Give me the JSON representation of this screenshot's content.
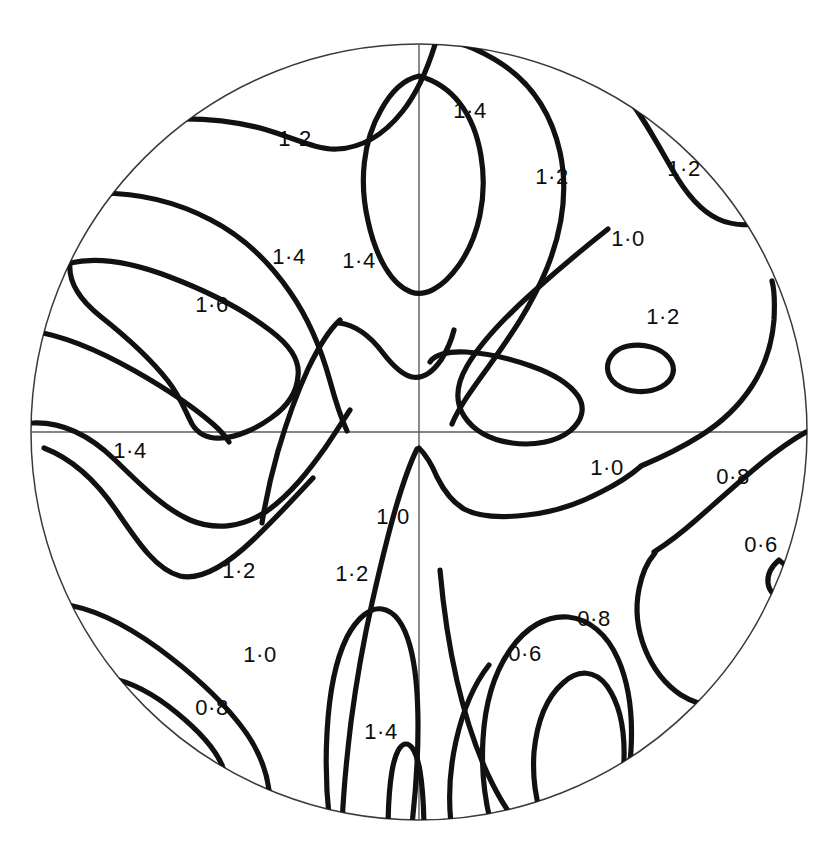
{
  "figure": {
    "kind": "stereographic-pole-figure",
    "title": "",
    "background_color": "#ffffff",
    "contour_color": "#111111",
    "outline_color": "#3a3a3a",
    "axis_color": "#5a5a5a"
  },
  "projection": {
    "center_x": 419,
    "center_y": 432,
    "radius": 388,
    "outline_stroke_width": 1.5,
    "contour_stroke_width": 5.2
  },
  "axes": {
    "horizontal": {
      "x1": 31,
      "y1": 432,
      "x2": 807,
      "y2": 432
    },
    "vertical": {
      "x1": 419,
      "y1": 44,
      "x2": 419,
      "y2": 820
    }
  },
  "chart_data": {
    "type": "contour",
    "title": "",
    "xlabel": "",
    "ylabel": "",
    "grid": false,
    "legend": "none",
    "units": "times random",
    "contour_interval": 0.2,
    "levels": [
      0.6,
      0.8,
      1.0,
      1.2,
      1.4,
      1.6
    ],
    "min_level": 0.6,
    "max_level": 1.6,
    "label_count": 21,
    "labels": [
      {
        "id": "lbl-1",
        "text": "1·2",
        "value": 1.2,
        "x": 295,
        "y": 140
      },
      {
        "id": "lbl-2",
        "text": "1·4",
        "value": 1.4,
        "x": 470,
        "y": 112
      },
      {
        "id": "lbl-3",
        "text": "1·2",
        "value": 1.2,
        "x": 552,
        "y": 178
      },
      {
        "id": "lbl-4",
        "text": "1·2",
        "value": 1.2,
        "x": 684,
        "y": 170
      },
      {
        "id": "lbl-5",
        "text": "1·4",
        "value": 1.4,
        "x": 289,
        "y": 258
      },
      {
        "id": "lbl-6",
        "text": "1·4",
        "value": 1.4,
        "x": 359,
        "y": 262
      },
      {
        "id": "lbl-7",
        "text": "1·0",
        "value": 1.0,
        "x": 628,
        "y": 240
      },
      {
        "id": "lbl-8",
        "text": "1·6",
        "value": 1.6,
        "x": 212,
        "y": 306
      },
      {
        "id": "lbl-9",
        "text": "1·2",
        "value": 1.2,
        "x": 663,
        "y": 318
      },
      {
        "id": "lbl-10",
        "text": "1·4",
        "value": 1.4,
        "x": 130,
        "y": 452
      },
      {
        "id": "lbl-11",
        "text": "1·0",
        "value": 1.0,
        "x": 607,
        "y": 469
      },
      {
        "id": "lbl-12",
        "text": "0·8",
        "value": 0.8,
        "x": 733,
        "y": 478
      },
      {
        "id": "lbl-13",
        "text": "1·0",
        "value": 1.0,
        "x": 393,
        "y": 518
      },
      {
        "id": "lbl-14",
        "text": "0·6",
        "value": 0.6,
        "x": 761,
        "y": 546
      },
      {
        "id": "lbl-15",
        "text": "1·2",
        "value": 1.2,
        "x": 239,
        "y": 572
      },
      {
        "id": "lbl-16",
        "text": "1·2",
        "value": 1.2,
        "x": 352,
        "y": 575
      },
      {
        "id": "lbl-17",
        "text": "0·8",
        "value": 0.8,
        "x": 594,
        "y": 620
      },
      {
        "id": "lbl-18",
        "text": "1·0",
        "value": 1.0,
        "x": 260,
        "y": 656
      },
      {
        "id": "lbl-19",
        "text": "0·6",
        "value": 0.6,
        "x": 525,
        "y": 655
      },
      {
        "id": "lbl-20",
        "text": "0·8",
        "value": 0.8,
        "x": 212,
        "y": 709
      },
      {
        "id": "lbl-21",
        "text": "1·4",
        "value": 1.4,
        "x": 381,
        "y": 733
      }
    ],
    "contours": [
      {
        "id": "c-top-arc-left",
        "level": 1.2,
        "closed": false,
        "d": "M 172 119 C 205 118 240 122 267 130 C 296 139 318 150 337 149 C 360 148 382 137 402 112 C 419 91 430 62 437 38"
      },
      {
        "id": "c-top-band-right",
        "level": 1.2,
        "closed": false,
        "d": "M 400 36 C 424 32 460 39 494 59 C 530 80 551 112 560 152 C 568 189 563 228 547 268 C 531 307 509 338 489 366 C 470 392 458 409 452 424"
      },
      {
        "id": "c-top-lobe-1_4",
        "level": 1.4,
        "closed": true,
        "d": "M 419 76 C 452 85 474 113 481 156 C 488 198 478 238 459 265 C 442 289 424 297 411 292 C 392 285 376 258 368 221 C 359 182 363 141 381 110 C 392 90 405 79 419 76 Z"
      },
      {
        "id": "c-upper-left-1_4",
        "level": 1.4,
        "closed": false,
        "d": "M 100 193 C 137 193 175 201 211 220 C 246 238 270 263 290 292 C 311 322 322 352 330 381 C 336 403 341 418 347 431"
      },
      {
        "id": "c-left-1_6-outer",
        "level": 1.6,
        "closed": true,
        "d": "M 70 263 C 96 257 131 262 170 277 C 212 293 248 313 271 331 C 292 347 300 361 298 376 C 297 392 288 406 271 418 C 256 429 237 437 222 438 C 208 439 198 434 192 424 C 185 411 180 396 168 381 C 150 358 124 335 100 316 C 80 300 68 283 70 263 Z"
      },
      {
        "id": "c-left-1_6-inner",
        "level": 1.6,
        "closed": false,
        "d": "M 32 331 C 60 335 96 349 135 371 C 172 392 198 411 213 424 C 221 431 226 437 229 442"
      },
      {
        "id": "c-left-lower-1_4",
        "level": 1.4,
        "closed": false,
        "d": "M 33 423 C 60 422 88 434 114 459 C 140 484 163 508 190 520 C 216 531 243 527 267 511 C 291 494 310 469 325 448 C 336 432 344 419 350 410"
      },
      {
        "id": "c-upperright-1_0-spike",
        "level": 1.0,
        "closed": false,
        "d": "M 608 229 C 589 244 562 266 532 293 C 503 319 480 344 467 366 C 456 385 455 402 464 416 C 473 430 490 440 512 443 C 534 446 556 442 570 431 C 582 421 586 408 578 396 C 569 383 551 373 531 366 C 506 357 483 353 466 352 C 447 351 434 355 430 362"
      },
      {
        "id": "c-upperright-1_2-island",
        "level": 1.2,
        "closed": true,
        "d": "M 628 346 C 644 343 661 348 669 358 C 677 368 674 380 661 387 C 647 394 628 393 616 384 C 605 375 605 362 614 353 C 618 349 623 347 628 346 Z"
      },
      {
        "id": "c-top-right-corner-1_2",
        "level": 1.2,
        "closed": false,
        "d": "M 622 90 C 641 113 657 143 672 169 C 686 194 701 211 718 219 C 733 226 752 226 768 222"
      },
      {
        "id": "c-center-saddle",
        "level": 1.2,
        "closed": false,
        "d": "M 339 323 C 356 325 371 337 383 353 C 393 366 403 375 412 377 C 422 379 432 373 441 360 C 448 349 452 338 454 330"
      },
      {
        "id": "c-center-left-drop",
        "level": 1.2,
        "closed": false,
        "d": "M 340 320 C 330 329 319 346 308 369 C 296 395 286 424 278 451 C 270 479 265 504 262 523"
      },
      {
        "id": "c-center-down-1_0",
        "level": 1.0,
        "closed": false,
        "d": "M 419 448 C 426 455 432 465 437 477 C 444 491 452 502 464 509 C 479 517 502 518 527 515 C 556 512 582 502 601 492 C 619 483 632 474 640 467"
      },
      {
        "id": "c-center-down-left",
        "level": 1.0,
        "closed": false,
        "d": "M 417 449 C 411 461 404 480 396 507 C 387 538 379 572 372 603 C 363 643 356 684 351 722 C 346 763 343 800 342 826"
      },
      {
        "id": "c-right-1_0-to-edge",
        "level": 1.0,
        "closed": false,
        "d": "M 641 466 C 660 458 681 448 700 436 C 721 423 739 406 752 386 C 765 366 772 345 774 320 C 775 300 774 288 772 281"
      },
      {
        "id": "c-right-0_8",
        "level": 0.8,
        "closed": false,
        "d": "M 806 432 C 790 441 772 454 752 471 C 731 489 712 506 696 520 C 679 535 665 545 654 552"
      },
      {
        "id": "c-right-0_8-lower",
        "level": 0.8,
        "closed": false,
        "d": "M 655 553 C 648 561 642 573 639 589 C 635 609 637 629 645 649 C 653 669 666 685 681 695 C 694 703 707 706 718 704"
      },
      {
        "id": "c-right-0_6-hook",
        "level": 0.6,
        "closed": false,
        "d": "M 779 560 C 772 566 767 574 768 583 C 769 592 776 598 784 597 C 791 595 795 588 793 580 C 791 572 786 565 779 560 Z"
      },
      {
        "id": "c-lowerleft-1_2",
        "level": 1.2,
        "closed": false,
        "d": "M 44 448 C 70 458 96 480 118 513 C 139 544 157 570 180 576 C 203 581 229 563 254 539 C 277 517 297 495 313 478"
      },
      {
        "id": "c-lowerleft-1_0",
        "level": 1.0,
        "closed": false,
        "d": "M 61 604 C 88 607 122 622 158 648 C 192 673 219 698 238 722 C 256 744 266 767 269 790 C 271 809 270 822 268 831"
      },
      {
        "id": "c-lowerleft-0_8",
        "level": 0.8,
        "closed": false,
        "d": "M 110 678 C 131 682 154 694 177 713 C 199 731 215 749 222 765 C 227 777 228 789 226 800 C 225 810 223 817 221 822"
      },
      {
        "id": "c-bottom-1_2-finger",
        "level": 1.2,
        "closed": false,
        "d": "M 331 833 C 327 804 325 769 327 733 C 329 695 335 661 347 637 C 357 618 370 607 382 609 C 394 611 404 624 410 646 C 416 668 418 696 418 726 C 418 762 415 800 411 833"
      },
      {
        "id": "c-bottom-1_4-spike",
        "level": 1.4,
        "closed": false,
        "d": "M 388 833 C 388 810 389 789 392 771 C 395 754 400 744 406 744 C 412 744 417 754 420 771 C 423 790 424 811 424 833"
      },
      {
        "id": "c-bottom-center-sweep",
        "level": 1.2,
        "closed": false,
        "d": "M 440 570 C 443 604 448 642 457 681 C 466 720 478 755 492 783 C 504 807 516 823 526 832"
      },
      {
        "id": "c-bottom-0_8-loop",
        "level": 0.8,
        "closed": false,
        "d": "M 493 831 C 485 803 481 772 483 739 C 485 704 494 673 510 650 C 526 627 547 615 568 617 C 589 619 607 634 618 659 C 629 684 633 716 631 750 C 629 783 621 812 610 833"
      },
      {
        "id": "c-bottom-0_6-loop",
        "level": 0.6,
        "closed": false,
        "d": "M 548 832 C 537 809 532 781 534 752 C 537 722 547 697 563 683 C 578 669 595 670 607 686 C 619 703 625 729 624 760 C 623 789 617 813 607 832"
      },
      {
        "id": "c-bottom-extra-inner",
        "level": 0.8,
        "closed": false,
        "d": "M 452 832 C 448 803 449 772 456 741 C 463 710 474 684 489 665"
      }
    ]
  }
}
